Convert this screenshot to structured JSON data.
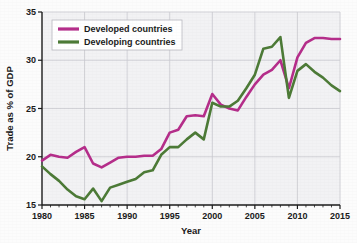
{
  "chart_data": {
    "type": "line",
    "title": "",
    "xlabel": "Year",
    "ylabel": "Trade as % of GDP",
    "xlim": [
      1980,
      2015
    ],
    "ylim": [
      15,
      35
    ],
    "ytick_labels": [
      "15",
      "20",
      "25",
      "30",
      "35"
    ],
    "yticks": [
      15,
      20,
      25,
      30,
      35
    ],
    "xtick_labels": [
      "1980",
      "1985",
      "1990",
      "1995",
      "2000",
      "2005",
      "2010",
      "2015"
    ],
    "xticks": [
      1980,
      1985,
      1990,
      1995,
      2000,
      2005,
      2010,
      2015
    ],
    "minor_xtick_interval": 1,
    "grid": true,
    "legend_position": "top-left",
    "x": [
      1980,
      1981,
      1982,
      1983,
      1984,
      1985,
      1986,
      1987,
      1988,
      1989,
      1990,
      1991,
      1992,
      1993,
      1994,
      1995,
      1996,
      1997,
      1998,
      1999,
      2000,
      2001,
      2002,
      2003,
      2004,
      2005,
      2006,
      2007,
      2008,
      2009,
      2010,
      2011,
      2012,
      2013,
      2014,
      2015
    ],
    "series": [
      {
        "name": "Developed countries",
        "color": "#b52d8a",
        "values": [
          19.6,
          20.2,
          20.0,
          19.9,
          20.5,
          21.0,
          19.3,
          18.9,
          19.4,
          19.9,
          20.0,
          20.0,
          20.1,
          20.1,
          20.8,
          22.5,
          22.8,
          24.2,
          24.3,
          24.2,
          26.5,
          25.4,
          25.0,
          24.8,
          26.2,
          27.5,
          28.5,
          29.0,
          30.0,
          27.1,
          30.3,
          31.8,
          32.3,
          32.3,
          32.2,
          32.2
        ]
      },
      {
        "name": "Developing countries",
        "color": "#4c7a36",
        "values": [
          19.0,
          18.2,
          17.5,
          16.6,
          15.9,
          15.6,
          16.7,
          15.4,
          16.8,
          17.1,
          17.4,
          17.7,
          18.4,
          18.6,
          20.2,
          21.0,
          21.0,
          21.8,
          22.5,
          21.8,
          25.6,
          25.2,
          25.2,
          25.8,
          27.1,
          28.5,
          31.2,
          31.4,
          32.4,
          26.1,
          28.9,
          29.6,
          28.8,
          28.2,
          27.4,
          26.8
        ]
      }
    ],
    "legend": [
      {
        "label": "Developed countries",
        "color": "#b52d8a"
      },
      {
        "label": "Developing countries",
        "color": "#4c7a36"
      }
    ]
  },
  "caption": {
    "text": ""
  },
  "colors": {
    "developed": "#b52d8a",
    "developing": "#4c7a36",
    "plot_background": "#f2f2f4",
    "grid": "#c9c9cf",
    "axis": "#1a1a1a"
  }
}
